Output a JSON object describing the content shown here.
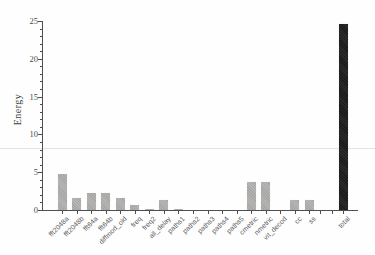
{
  "figure": {
    "background_color": "#fefefe",
    "scan_artifact_line_color": "#e3e3e3"
  },
  "chart_data": {
    "type": "bar",
    "title": "",
    "xlabel": "",
    "ylabel": "Energy",
    "ylim": [
      0,
      25
    ],
    "y_major_ticks": [
      0,
      5,
      10,
      15,
      20,
      25
    ],
    "y_minor_tick_step": 1,
    "grid": "off",
    "legend": "none",
    "categories": [
      "fft2048a",
      "fft2048b",
      "fft64a",
      "fft64b",
      "diffmod_old",
      "freq",
      "freq2",
      "all_delay",
      "paths1",
      "paths2",
      "paths3",
      "paths4",
      "paths5",
      "cmetric",
      "nmetric",
      "vit_decod",
      "cc",
      "ss",
      "total"
    ],
    "values": [
      4.8,
      1.6,
      2.3,
      2.3,
      1.6,
      0.65,
      0.15,
      1.35,
      0.1,
      0.05,
      0.05,
      0.05,
      0.05,
      3.65,
      3.65,
      0.05,
      1.3,
      1.3,
      24.6
    ],
    "highlighted_category": "total",
    "separated_last": true,
    "bar_color": "#b2b1b0",
    "highlight_bar_color": "#232323",
    "axis_color": "#4f4f4f",
    "tick_label_color": "#4a4a4a",
    "category_label_color": "#5c5c5c"
  }
}
